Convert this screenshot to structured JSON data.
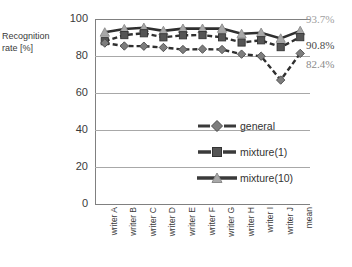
{
  "chart_data": {
    "type": "line",
    "title": "",
    "xlabel": "",
    "ylabel": "Recognition rate [%]",
    "ylim": [
      0,
      100
    ],
    "yticks": [
      0,
      20,
      40,
      60,
      80,
      100
    ],
    "grid": true,
    "legend_position": "center-right-inside",
    "categories": [
      "writer A",
      "writer B",
      "writer C",
      "writer D",
      "writer E",
      "writer F",
      "writer G",
      "writer H",
      "writer I",
      "writer J",
      "mean"
    ],
    "series": [
      {
        "name": "general",
        "marker": "diamond",
        "line": "dashed",
        "color": "#7d7d7d",
        "values": [
          87.0,
          85.4,
          85.3,
          84.6,
          83.5,
          83.7,
          83.5,
          81.0,
          79.9,
          67.0,
          81.4
        ]
      },
      {
        "name": "mixture(1)",
        "marker": "square",
        "line": "dashed",
        "color": "#555555",
        "values": [
          88.0,
          91.3,
          92.3,
          90.1,
          91.2,
          91.3,
          90.1,
          87.3,
          88.5,
          84.8,
          90.2
        ]
      },
      {
        "name": "mixture(10)",
        "marker": "triangle",
        "line": "solid",
        "color": "#a8a8a8",
        "values": [
          92.8,
          94.6,
          95.3,
          93.6,
          94.8,
          94.8,
          94.9,
          92.0,
          92.6,
          89.5,
          93.6
        ]
      }
    ],
    "annotations": [
      {
        "text": "93.7%",
        "color": "#a0a0a0",
        "series": "mixture(10)"
      },
      {
        "text": "90.8%",
        "color": "#4a4a4a",
        "series": "mixture(1)"
      },
      {
        "text": "82.4%",
        "color": "#8a8a8a",
        "series": "general"
      }
    ]
  },
  "axis": {
    "y_title_line1": "Recognition",
    "y_title_line2": "rate [%]",
    "y_tick_labels": [
      "100",
      "80",
      "60",
      "40",
      "20",
      "0"
    ]
  },
  "legend": {
    "items": [
      {
        "label": "general"
      },
      {
        "label": "mixture(1)"
      },
      {
        "label": "mixture(10)"
      }
    ]
  },
  "colors": {
    "general": "#7d7d7d",
    "mixture1": "#555555",
    "mixture10": "#a8a8a8",
    "axis": "#808080",
    "grid": "#a8a8a8"
  }
}
